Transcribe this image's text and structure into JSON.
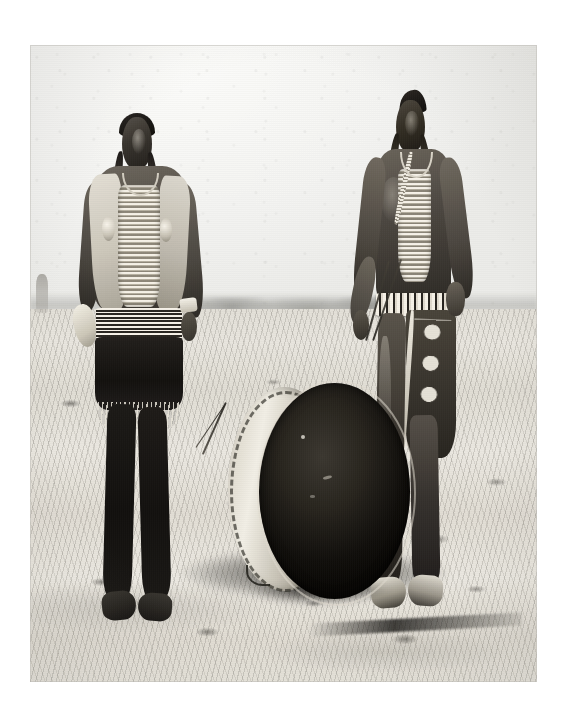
{
  "page": {
    "background_color": "#ffffff",
    "width": 566,
    "height": 722,
    "medium": "printed black-and-white photographic plate on white page",
    "caption": "",
    "title": ""
  },
  "photograph": {
    "name": "historic-photograph",
    "type": "black-and-white photograph",
    "left": 30,
    "top": 45,
    "width": 507,
    "height": 637,
    "tone": "monochrome, high-contrast silver gelatin print",
    "border_color": "#bebcb6",
    "description": "Two Native American men stand outdoors on open dry prairie with a large double-headed drum resting on the ground between them."
  },
  "scene": {
    "setting": "open flat prairie / grassland under a pale overcast sky",
    "horizon_position_percent": 41,
    "sky": {
      "name": "sky",
      "color": "#eeeeec",
      "description": "flat, bright, almost featureless pale gray sky"
    },
    "distant_ridge": {
      "name": "distant-ridge",
      "description": "faint low ridge and indistinct dark shapes along the horizon"
    },
    "ground": {
      "name": "ground",
      "color": "#ddd9d1",
      "description": "sun-bleached short grass with scattered dark tufts and a trampled dark band behind the drum"
    },
    "background_figure": {
      "name": "background-figure",
      "description": "very small indistinct figure near the far left edge at the horizon"
    }
  },
  "subjects": [
    {
      "id": "man-left",
      "name": "man-left",
      "position": "left side of frame, facing camera",
      "hair": "long dark hair with two wrapped braids falling in front of the shoulders",
      "attire": [
        "light-colored hide vest",
        "long bone hairpipe breastplate",
        "beaded neck choker",
        "two round shell or metal disc ornaments on the chest",
        "striped woven sash or belt at the waist",
        "dark breechcloth with pale fringe",
        "dark leggings",
        "moccasins"
      ],
      "holding": {
        "left_hand": "pale feather fan or bundle",
        "right_hand": "drumstick angled toward the drum"
      }
    },
    {
      "id": "man-right",
      "name": "man-right",
      "position": "right side of frame, facing camera, bare chested",
      "hair": "dark hair swept up in front with two long wrapped braids",
      "attire": [
        "bone hairpipe breastplate over bare chest",
        "beaded necklace",
        "wide beaded belt at the waist",
        "geometric diamond-patterned blanket or breechcloth over the hip",
        "dark leggings",
        "light moccasins"
      ],
      "holding": {
        "left_hand": "pair of thin drumsticks pointing down toward the drum",
        "right_hand": "resting on hip"
      }
    }
  ],
  "objects": [
    {
      "id": "drum",
      "name": "large-drum",
      "description": "large double-headed dance drum standing on edge between the two men",
      "shell": "pale wooden shell with dark rawhide lacing around the rim, visible on the left",
      "head": "broad dark rawhide drum head facing the camera at a slight angle",
      "shadow": "dark cast shadow and trampled grass beneath the drum"
    },
    {
      "id": "drumsticks",
      "name": "drumsticks",
      "description": "slim drumsticks held by both men, angled toward the drum"
    }
  ]
}
